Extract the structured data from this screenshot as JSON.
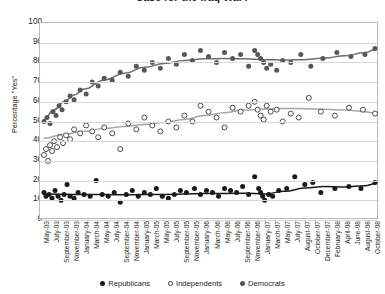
{
  "chart": {
    "title": "Case for the Iraq War?",
    "ylabel": "Percentage \"Yes\"",
    "ytick_labels": [
      "100",
      "90",
      "80",
      "70",
      "60",
      "50",
      "40",
      "30",
      "20",
      "10",
      "0"
    ],
    "legend": [
      {
        "label": "Republicans",
        "marker": "filled-black-dot",
        "color": "#1a1a1a"
      },
      {
        "label": "Independents",
        "marker": "open-circle",
        "color": "#ffffff"
      },
      {
        "label": "Democrats",
        "marker": "filled-gray-dot",
        "color": "#585858"
      }
    ]
  },
  "chart_data": {
    "type": "scatter",
    "title": "Case for the Iraq War?",
    "xlabel": "",
    "ylabel": "Percentage \"Yes\"",
    "ylim": [
      0,
      100
    ],
    "ytick_step": 10,
    "grid": true,
    "legend_position": "bottom",
    "categories": [
      "May-03",
      "July-03",
      "September-03",
      "November-03",
      "January-04",
      "March-04",
      "May-04",
      "July-04",
      "September-04",
      "November-04",
      "January-05",
      "March-05",
      "May-05",
      "July-05",
      "September-05",
      "November-05",
      "January-06",
      "March-06",
      "May-06",
      "July-06",
      "September-06",
      "November-06",
      "January-07",
      "March-07",
      "May-07",
      "July-07",
      "August-07",
      "October-07",
      "December-07",
      "February-08",
      "April-08",
      "June-08",
      "August-08",
      "October-08"
    ],
    "series": [
      {
        "name": "Republicans",
        "marker": "filled-black-dot",
        "color": "#1a1a1a",
        "trend_color": "#1a1a1a",
        "points": [
          {
            "x": 0.0,
            "y": 14
          },
          {
            "x": 0.2,
            "y": 12
          },
          {
            "x": 0.5,
            "y": 13
          },
          {
            "x": 0.8,
            "y": 11
          },
          {
            "x": 1.1,
            "y": 15
          },
          {
            "x": 1.4,
            "y": 12
          },
          {
            "x": 1.7,
            "y": 10
          },
          {
            "x": 2.0,
            "y": 13
          },
          {
            "x": 2.3,
            "y": 18
          },
          {
            "x": 2.6,
            "y": 12
          },
          {
            "x": 3.0,
            "y": 11
          },
          {
            "x": 3.4,
            "y": 14
          },
          {
            "x": 4.0,
            "y": 13
          },
          {
            "x": 4.6,
            "y": 12
          },
          {
            "x": 5.2,
            "y": 20
          },
          {
            "x": 5.8,
            "y": 13
          },
          {
            "x": 6.4,
            "y": 12
          },
          {
            "x": 7.0,
            "y": 14
          },
          {
            "x": 7.6,
            "y": 9
          },
          {
            "x": 8.2,
            "y": 13
          },
          {
            "x": 8.8,
            "y": 15
          },
          {
            "x": 9.4,
            "y": 12
          },
          {
            "x": 10.0,
            "y": 14
          },
          {
            "x": 10.6,
            "y": 13
          },
          {
            "x": 11.2,
            "y": 16
          },
          {
            "x": 11.8,
            "y": 12
          },
          {
            "x": 12.4,
            "y": 11
          },
          {
            "x": 13.0,
            "y": 13
          },
          {
            "x": 13.6,
            "y": 15
          },
          {
            "x": 14.2,
            "y": 14
          },
          {
            "x": 15.0,
            "y": 16
          },
          {
            "x": 15.6,
            "y": 13
          },
          {
            "x": 16.2,
            "y": 15
          },
          {
            "x": 16.8,
            "y": 14
          },
          {
            "x": 17.4,
            "y": 12
          },
          {
            "x": 18.0,
            "y": 16
          },
          {
            "x": 18.6,
            "y": 15
          },
          {
            "x": 19.2,
            "y": 14
          },
          {
            "x": 19.8,
            "y": 17
          },
          {
            "x": 20.4,
            "y": 13
          },
          {
            "x": 21.0,
            "y": 22
          },
          {
            "x": 21.4,
            "y": 16
          },
          {
            "x": 21.6,
            "y": 14
          },
          {
            "x": 21.8,
            "y": 12
          },
          {
            "x": 22.0,
            "y": 10
          },
          {
            "x": 22.4,
            "y": 13
          },
          {
            "x": 22.8,
            "y": 12
          },
          {
            "x": 23.4,
            "y": 15
          },
          {
            "x": 24.2,
            "y": 16
          },
          {
            "x": 25.0,
            "y": 22
          },
          {
            "x": 26.0,
            "y": 18
          },
          {
            "x": 26.8,
            "y": 19
          },
          {
            "x": 27.6,
            "y": 14
          },
          {
            "x": 29.0,
            "y": 16
          },
          {
            "x": 30.4,
            "y": 17
          },
          {
            "x": 31.6,
            "y": 16
          },
          {
            "x": 33.0,
            "y": 19
          }
        ],
        "trend": [
          {
            "x": 0,
            "y": 13.2
          },
          {
            "x": 4,
            "y": 13.0
          },
          {
            "x": 8,
            "y": 12.8
          },
          {
            "x": 12,
            "y": 13.0
          },
          {
            "x": 16,
            "y": 13.4
          },
          {
            "x": 20,
            "y": 13.6
          },
          {
            "x": 22,
            "y": 13.2
          },
          {
            "x": 24,
            "y": 14.6
          },
          {
            "x": 26,
            "y": 16.2
          },
          {
            "x": 28,
            "y": 17.0
          },
          {
            "x": 30,
            "y": 16.8
          },
          {
            "x": 32,
            "y": 17.4
          },
          {
            "x": 33,
            "y": 18.4
          }
        ]
      },
      {
        "name": "Independents",
        "marker": "open-circle",
        "color": "#ffffff",
        "trend_color": "#a6a6a6",
        "points": [
          {
            "x": 0.0,
            "y": 33
          },
          {
            "x": 0.2,
            "y": 36
          },
          {
            "x": 0.4,
            "y": 30
          },
          {
            "x": 0.6,
            "y": 38
          },
          {
            "x": 0.8,
            "y": 35
          },
          {
            "x": 1.0,
            "y": 40
          },
          {
            "x": 1.3,
            "y": 37
          },
          {
            "x": 1.6,
            "y": 42
          },
          {
            "x": 1.9,
            "y": 39
          },
          {
            "x": 2.2,
            "y": 43
          },
          {
            "x": 2.6,
            "y": 41
          },
          {
            "x": 3.0,
            "y": 46
          },
          {
            "x": 3.6,
            "y": 44
          },
          {
            "x": 4.2,
            "y": 48
          },
          {
            "x": 4.8,
            "y": 45
          },
          {
            "x": 5.4,
            "y": 42
          },
          {
            "x": 6.0,
            "y": 47
          },
          {
            "x": 6.8,
            "y": 44
          },
          {
            "x": 7.6,
            "y": 36
          },
          {
            "x": 8.4,
            "y": 49
          },
          {
            "x": 9.2,
            "y": 46
          },
          {
            "x": 10.0,
            "y": 52
          },
          {
            "x": 10.8,
            "y": 48
          },
          {
            "x": 11.6,
            "y": 45
          },
          {
            "x": 12.4,
            "y": 50
          },
          {
            "x": 13.2,
            "y": 47
          },
          {
            "x": 14.0,
            "y": 53
          },
          {
            "x": 14.8,
            "y": 50
          },
          {
            "x": 15.6,
            "y": 58
          },
          {
            "x": 16.4,
            "y": 55
          },
          {
            "x": 17.2,
            "y": 52
          },
          {
            "x": 18.0,
            "y": 47
          },
          {
            "x": 18.8,
            "y": 57
          },
          {
            "x": 19.6,
            "y": 55
          },
          {
            "x": 20.4,
            "y": 58
          },
          {
            "x": 21.0,
            "y": 60
          },
          {
            "x": 21.3,
            "y": 56
          },
          {
            "x": 21.6,
            "y": 53
          },
          {
            "x": 21.9,
            "y": 51
          },
          {
            "x": 22.2,
            "y": 58
          },
          {
            "x": 22.6,
            "y": 55
          },
          {
            "x": 23.2,
            "y": 56
          },
          {
            "x": 23.8,
            "y": 50
          },
          {
            "x": 24.6,
            "y": 54
          },
          {
            "x": 25.4,
            "y": 52
          },
          {
            "x": 26.4,
            "y": 62
          },
          {
            "x": 27.6,
            "y": 55
          },
          {
            "x": 29.0,
            "y": 53
          },
          {
            "x": 30.4,
            "y": 57
          },
          {
            "x": 31.8,
            "y": 56
          },
          {
            "x": 33.0,
            "y": 54
          }
        ],
        "trend": [
          {
            "x": 0,
            "y": 41.5
          },
          {
            "x": 2,
            "y": 43.5
          },
          {
            "x": 4,
            "y": 45.0
          },
          {
            "x": 6,
            "y": 46.5
          },
          {
            "x": 8,
            "y": 47.5
          },
          {
            "x": 10,
            "y": 48.5
          },
          {
            "x": 12,
            "y": 49.5
          },
          {
            "x": 14,
            "y": 51.0
          },
          {
            "x": 16,
            "y": 53.0
          },
          {
            "x": 18,
            "y": 54.5
          },
          {
            "x": 20,
            "y": 55.8
          },
          {
            "x": 22,
            "y": 56.4
          },
          {
            "x": 24,
            "y": 56.6
          },
          {
            "x": 26,
            "y": 56.5
          },
          {
            "x": 28,
            "y": 56.2
          },
          {
            "x": 30,
            "y": 55.8
          },
          {
            "x": 32,
            "y": 55.0
          },
          {
            "x": 33,
            "y": 54.2
          }
        ]
      },
      {
        "name": "Democrats",
        "marker": "filled-gray-dot",
        "color": "#585858",
        "trend_color": "#6e6e6e",
        "points": [
          {
            "x": 0.0,
            "y": 50
          },
          {
            "x": 0.3,
            "y": 52
          },
          {
            "x": 0.6,
            "y": 49
          },
          {
            "x": 0.9,
            "y": 55
          },
          {
            "x": 1.2,
            "y": 53
          },
          {
            "x": 1.5,
            "y": 58
          },
          {
            "x": 1.8,
            "y": 56
          },
          {
            "x": 2.2,
            "y": 60
          },
          {
            "x": 2.6,
            "y": 63
          },
          {
            "x": 3.0,
            "y": 61
          },
          {
            "x": 3.6,
            "y": 66
          },
          {
            "x": 4.2,
            "y": 64
          },
          {
            "x": 4.8,
            "y": 70
          },
          {
            "x": 5.4,
            "y": 68
          },
          {
            "x": 6.0,
            "y": 72
          },
          {
            "x": 6.8,
            "y": 71
          },
          {
            "x": 7.6,
            "y": 75
          },
          {
            "x": 8.4,
            "y": 73
          },
          {
            "x": 9.2,
            "y": 78
          },
          {
            "x": 10.0,
            "y": 76
          },
          {
            "x": 10.8,
            "y": 80
          },
          {
            "x": 11.6,
            "y": 77
          },
          {
            "x": 12.4,
            "y": 82
          },
          {
            "x": 13.2,
            "y": 79
          },
          {
            "x": 14.0,
            "y": 84
          },
          {
            "x": 14.8,
            "y": 81
          },
          {
            "x": 15.6,
            "y": 86
          },
          {
            "x": 16.4,
            "y": 83
          },
          {
            "x": 17.2,
            "y": 80
          },
          {
            "x": 18.0,
            "y": 85
          },
          {
            "x": 18.8,
            "y": 82
          },
          {
            "x": 19.6,
            "y": 84
          },
          {
            "x": 20.4,
            "y": 78
          },
          {
            "x": 21.0,
            "y": 86
          },
          {
            "x": 21.3,
            "y": 84
          },
          {
            "x": 21.6,
            "y": 82
          },
          {
            "x": 21.9,
            "y": 80
          },
          {
            "x": 22.2,
            "y": 77
          },
          {
            "x": 22.6,
            "y": 79
          },
          {
            "x": 23.2,
            "y": 76
          },
          {
            "x": 23.8,
            "y": 81
          },
          {
            "x": 24.6,
            "y": 80
          },
          {
            "x": 25.6,
            "y": 84
          },
          {
            "x": 26.6,
            "y": 78
          },
          {
            "x": 27.8,
            "y": 82
          },
          {
            "x": 29.2,
            "y": 85
          },
          {
            "x": 30.6,
            "y": 83
          },
          {
            "x": 32.0,
            "y": 84
          },
          {
            "x": 33.0,
            "y": 87
          }
        ],
        "trend": [
          {
            "x": 0,
            "y": 51.0
          },
          {
            "x": 1,
            "y": 56.0
          },
          {
            "x": 2,
            "y": 60.0
          },
          {
            "x": 3,
            "y": 63.5
          },
          {
            "x": 4,
            "y": 66.5
          },
          {
            "x": 6,
            "y": 71.0
          },
          {
            "x": 8,
            "y": 74.5
          },
          {
            "x": 10,
            "y": 77.5
          },
          {
            "x": 12,
            "y": 79.5
          },
          {
            "x": 14,
            "y": 81.0
          },
          {
            "x": 16,
            "y": 81.8
          },
          {
            "x": 18,
            "y": 82.0
          },
          {
            "x": 20,
            "y": 81.8
          },
          {
            "x": 22,
            "y": 81.4
          },
          {
            "x": 24,
            "y": 81.2
          },
          {
            "x": 26,
            "y": 81.4
          },
          {
            "x": 28,
            "y": 82.2
          },
          {
            "x": 30,
            "y": 83.4
          },
          {
            "x": 32,
            "y": 85.0
          },
          {
            "x": 33,
            "y": 86.4
          }
        ]
      }
    ]
  }
}
